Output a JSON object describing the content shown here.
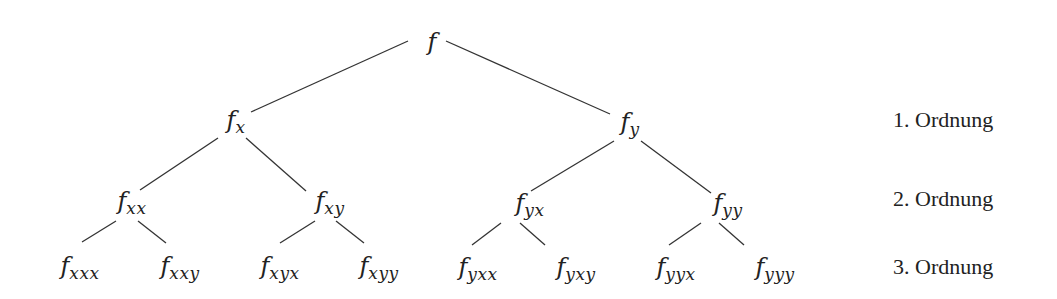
{
  "diagram": {
    "type": "tree",
    "title": "",
    "nodes": [
      {
        "id": "f",
        "base": "f",
        "sub": "",
        "level": 0,
        "x": 432,
        "y": 42
      },
      {
        "id": "fx",
        "base": "f",
        "sub": "x",
        "level": 1,
        "x": 236,
        "y": 121
      },
      {
        "id": "fy",
        "base": "f",
        "sub": "y",
        "level": 1,
        "x": 630,
        "y": 123
      },
      {
        "id": "fxx",
        "base": "f",
        "sub": "xx",
        "level": 2,
        "x": 132,
        "y": 202
      },
      {
        "id": "fxy",
        "base": "f",
        "sub": "xy",
        "level": 2,
        "x": 330,
        "y": 202
      },
      {
        "id": "fyx",
        "base": "f",
        "sub": "yx",
        "level": 2,
        "x": 530,
        "y": 204
      },
      {
        "id": "fyy",
        "base": "f",
        "sub": "yy",
        "level": 2,
        "x": 728,
        "y": 204
      },
      {
        "id": "fxxx",
        "base": "f",
        "sub": "xxx",
        "level": 3,
        "x": 80,
        "y": 267
      },
      {
        "id": "fxxy",
        "base": "f",
        "sub": "xxy",
        "level": 3,
        "x": 180,
        "y": 267
      },
      {
        "id": "fxyx",
        "base": "f",
        "sub": "xyx",
        "level": 3,
        "x": 280,
        "y": 267
      },
      {
        "id": "fxyy",
        "base": "f",
        "sub": "xyy",
        "level": 3,
        "x": 379,
        "y": 267
      },
      {
        "id": "fyxx",
        "base": "f",
        "sub": "yxx",
        "level": 3,
        "x": 478,
        "y": 268
      },
      {
        "id": "fyxy",
        "base": "f",
        "sub": "yxy",
        "level": 3,
        "x": 576,
        "y": 268
      },
      {
        "id": "fyyx",
        "base": "f",
        "sub": "yyx",
        "level": 3,
        "x": 676,
        "y": 268
      },
      {
        "id": "fyyy",
        "base": "f",
        "sub": "yyy",
        "level": 3,
        "x": 775,
        "y": 268
      }
    ],
    "edges": [
      {
        "from": "f",
        "to": "fx",
        "x1": 408,
        "y1": 41,
        "x2": 251,
        "y2": 112
      },
      {
        "from": "f",
        "to": "fy",
        "x1": 446,
        "y1": 41,
        "x2": 610,
        "y2": 114
      },
      {
        "from": "fx",
        "to": "fxx",
        "x1": 218,
        "y1": 138,
        "x2": 140,
        "y2": 190
      },
      {
        "from": "fx",
        "to": "fxy",
        "x1": 246,
        "y1": 138,
        "x2": 306,
        "y2": 191
      },
      {
        "from": "fy",
        "to": "fyx",
        "x1": 614,
        "y1": 141,
        "x2": 531,
        "y2": 191
      },
      {
        "from": "fy",
        "to": "fyy",
        "x1": 641,
        "y1": 141,
        "x2": 711,
        "y2": 193
      },
      {
        "from": "fxx",
        "to": "fxxx",
        "x1": 116,
        "y1": 221,
        "x2": 82,
        "y2": 242
      },
      {
        "from": "fxx",
        "to": "fxxy",
        "x1": 138,
        "y1": 221,
        "x2": 166,
        "y2": 243
      },
      {
        "from": "fxy",
        "to": "fxyx",
        "x1": 315,
        "y1": 221,
        "x2": 280,
        "y2": 243
      },
      {
        "from": "fxy",
        "to": "fxyy",
        "x1": 336,
        "y1": 221,
        "x2": 364,
        "y2": 243
      },
      {
        "from": "fyx",
        "to": "fyxx",
        "x1": 501,
        "y1": 223,
        "x2": 472,
        "y2": 245
      },
      {
        "from": "fyx",
        "to": "fyxy",
        "x1": 520,
        "y1": 223,
        "x2": 545,
        "y2": 245
      },
      {
        "from": "fyy",
        "to": "fyyx",
        "x1": 701,
        "y1": 223,
        "x2": 669,
        "y2": 245
      },
      {
        "from": "fyy",
        "to": "fyyy",
        "x1": 719,
        "y1": 223,
        "x2": 744,
        "y2": 245
      }
    ],
    "level_labels": [
      {
        "text": "1. Ordnung",
        "x": 893,
        "y": 120
      },
      {
        "text": "2. Ordnung",
        "x": 893,
        "y": 199
      },
      {
        "text": "3. Ordnung",
        "x": 893,
        "y": 267
      }
    ],
    "colors": {
      "line": "#333333",
      "text": "#222222",
      "background": "#ffffff"
    }
  }
}
